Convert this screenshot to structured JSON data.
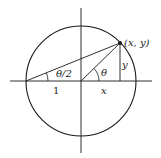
{
  "diagram": {
    "colors": {
      "stroke": "#1a1a1a",
      "background": "#ffffff"
    },
    "labels": {
      "point": "(x, y)",
      "theta": "θ",
      "half_theta": "θ/2",
      "one": "1",
      "x": "x",
      "y": "y"
    },
    "geometry": {
      "center": [
        81,
        81
      ],
      "radius": 55,
      "point_on_circle": [
        120,
        43
      ],
      "left_point": [
        26,
        81
      ]
    }
  }
}
